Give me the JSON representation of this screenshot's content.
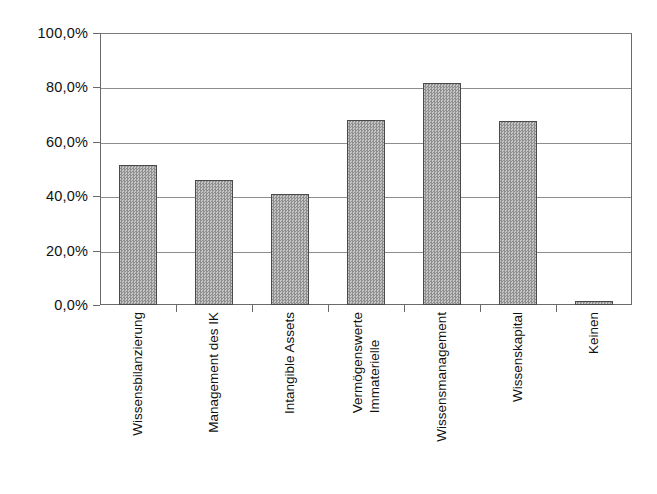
{
  "chart_data": {
    "type": "bar",
    "title": "",
    "subtitle": "",
    "xlabel": "",
    "ylabel": "",
    "categories": [
      "Wissensbilanzierung",
      "Management des IK",
      "Intangible Assets",
      "Immaterielle Vermögenswerte",
      "Wissensmanagement",
      "Wissenskapital",
      "Keinen"
    ],
    "category_lines": [
      [
        "Wissensbilanzierung"
      ],
      [
        "Management des IK"
      ],
      [
        "Intangible Assets"
      ],
      [
        "Immaterielle",
        "Vermögenswerte"
      ],
      [
        "Wissensmanagement"
      ],
      [
        "Wissenskapital"
      ],
      [
        "Keinen"
      ]
    ],
    "values": [
      51.5,
      46.0,
      40.8,
      68.0,
      81.5,
      67.6,
      1.5
    ],
    "value_labels": [
      "51,5%",
      "46,0%",
      "40,8%",
      "68,0%",
      "81,5%",
      "67,6%",
      "1,5%"
    ],
    "ylim": [
      0,
      100
    ],
    "ytick_values": [
      0,
      20,
      40,
      60,
      80,
      100
    ],
    "ytick_labels": [
      "0,0%",
      "20,0%",
      "40,0%",
      "60,0%",
      "80,0%",
      "100,0%"
    ],
    "grid": true,
    "grid_axis": "y",
    "legend": false,
    "legend_position": "none",
    "bar_fill_color": "#a8a8a8",
    "bar_edge_color": "#4a4a4a",
    "grid_color": "#8d8d8d",
    "axis_color": "#6a6a6a",
    "background_color": "#ffffff",
    "text_color": "#111111"
  }
}
